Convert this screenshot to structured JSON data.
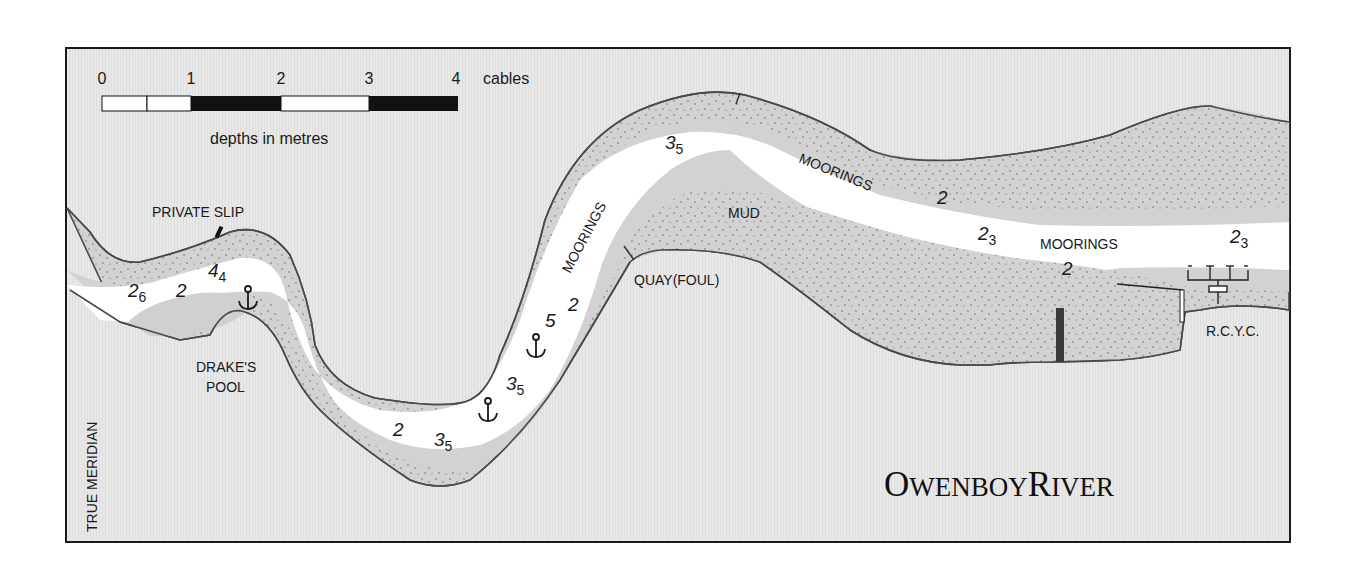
{
  "map": {
    "title": {
      "main_initial_1": "O",
      "main_rest_1": "WENBOY",
      "main_initial_2": "R",
      "main_rest_2": "IVER"
    },
    "meridian_label": "TRUE MERIDIAN",
    "scale_bar": {
      "ticks": [
        "0",
        "1",
        "2",
        "3",
        "4"
      ],
      "unit": "cables",
      "depth_note": "depths in metres"
    },
    "place_labels": {
      "private_slip": "PRIVATE SLIP",
      "drakes_pool_line1": "DRAKE'S",
      "drakes_pool_line2": "POOL",
      "quay": "QUAY(FOUL)",
      "mud": "MUD",
      "rcyc": "R.C.Y.C.",
      "moorings_1": "MOORINGS",
      "moorings_2": "MOORINGS",
      "moorings_3": "MOORINGS"
    },
    "soundings": [
      {
        "main": "2",
        "sub": "6"
      },
      {
        "main": "2",
        "sub": ""
      },
      {
        "main": "4",
        "sub": "4"
      },
      {
        "main": "2",
        "sub": ""
      },
      {
        "main": "3",
        "sub": "5"
      },
      {
        "main": "3",
        "sub": "5"
      },
      {
        "main": "5",
        "sub": ""
      },
      {
        "main": "2",
        "sub": ""
      },
      {
        "main": "3",
        "sub": "5"
      },
      {
        "main": "2",
        "sub": ""
      },
      {
        "main": "2",
        "sub": "3"
      },
      {
        "main": "2",
        "sub": ""
      },
      {
        "main": "2",
        "sub": "3"
      }
    ],
    "anchorages": [
      "anchor-icon",
      "anchor-icon",
      "anchor-icon"
    ],
    "colors": {
      "land": "#e6e6e6",
      "drying": "#d4d4d4",
      "channel": "#ffffff",
      "shoreline": "#4a4a4a",
      "frame": "#1a1a1a"
    }
  }
}
